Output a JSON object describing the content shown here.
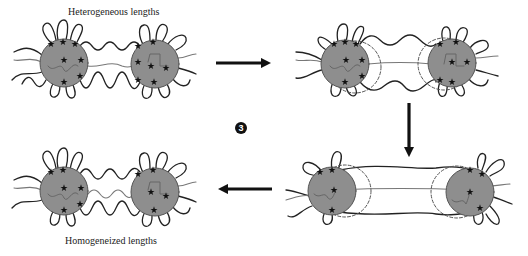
{
  "figure": {
    "step_number": "3",
    "labels": {
      "top": "Heterogeneous lengths",
      "bottom": "Homogeneized lengths"
    },
    "colors": {
      "background": "#ffffff",
      "sphere_fill": "#8e8e8e",
      "sphere_stroke": "#555555",
      "chain_dark": "#222222",
      "chain_light": "#777777",
      "arrow": "#111111",
      "dashed": "#555555",
      "star": "#111111"
    },
    "panels": [
      {
        "id": "panel-1",
        "position": "top-left",
        "state": "heterogeneous chain lengths",
        "spheres": [
          {
            "cx": 64,
            "cy": 63
          },
          {
            "cx": 155,
            "cy": 64
          }
        ],
        "dashed_shells": false
      },
      {
        "id": "panel-2",
        "position": "top-right",
        "state": "stretching, shells shown",
        "spheres": [
          {
            "cx": 345,
            "cy": 64
          },
          {
            "cx": 452,
            "cy": 63
          }
        ],
        "dashed_shells": true
      },
      {
        "id": "panel-3",
        "position": "bottom-right",
        "state": "fully stretched bridges",
        "spheres": [
          {
            "cx": 332,
            "cy": 191
          },
          {
            "cx": 470,
            "cy": 192
          }
        ],
        "dashed_shells": true
      },
      {
        "id": "panel-4",
        "position": "bottom-left",
        "state": "homogeneized chain lengths",
        "spheres": [
          {
            "cx": 64,
            "cy": 191
          },
          {
            "cx": 155,
            "cy": 192
          }
        ],
        "dashed_shells": false
      }
    ],
    "arrows": [
      {
        "direction": "right",
        "from": "panel-1",
        "to": "panel-2"
      },
      {
        "direction": "down",
        "from": "panel-2",
        "to": "panel-3"
      },
      {
        "direction": "left",
        "from": "panel-3",
        "to": "panel-4"
      }
    ]
  }
}
